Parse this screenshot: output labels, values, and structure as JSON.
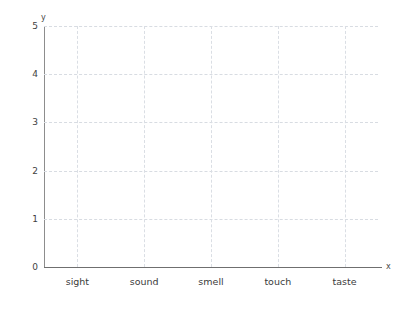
{
  "chart_data": {
    "type": "bar",
    "title": "",
    "subtitle": "",
    "xlabel": "x",
    "ylabel": "y",
    "categories": [
      "sight",
      "sound",
      "smell",
      "touch",
      "taste"
    ],
    "values": [
      null,
      null,
      null,
      null,
      null
    ],
    "series": [],
    "ytick_labels": [
      "0",
      "1",
      "2",
      "3",
      "4",
      "5"
    ],
    "ylim": [
      0,
      5
    ],
    "ystep": 1,
    "grid": true,
    "grid_style": "dashed",
    "legend": false,
    "legend_position": "none",
    "note": "empty plot template - no data plotted",
    "colors": {
      "background": "#ffffff",
      "axis": "#6f6f6f",
      "axis_y": "#8d8d8d",
      "grid": "#d8dce2",
      "text": "#3b3b3b"
    }
  },
  "axes": {
    "y_axis_label": "y",
    "x_axis_label": "x"
  }
}
